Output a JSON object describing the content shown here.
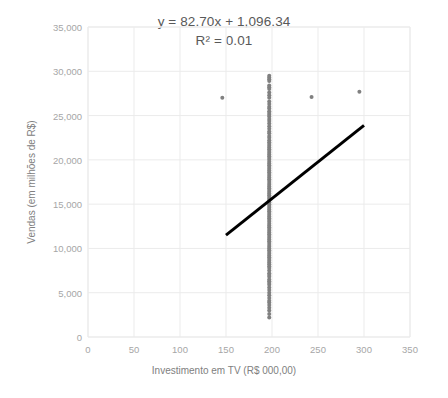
{
  "chart_data": {
    "type": "scatter",
    "title": "",
    "xlabel": "Investimento em TV (R$ 000,00)",
    "ylabel": "Vendas (em milhões de R$)",
    "xlim": [
      0,
      350
    ],
    "ylim": [
      0,
      35000
    ],
    "xticks": [
      0,
      50,
      100,
      150,
      200,
      250,
      300,
      350
    ],
    "yticks": [
      0,
      5000,
      10000,
      15000,
      20000,
      25000,
      30000,
      35000
    ],
    "xtick_labels": [
      "0",
      "50",
      "100",
      "150",
      "200",
      "250",
      "300",
      "350"
    ],
    "ytick_labels": [
      "0",
      "5,000",
      "10,000",
      "15,000",
      "20,000",
      "25,000",
      "30,000",
      "35,000"
    ],
    "grid": true,
    "legend": false,
    "annotations": {
      "equation": "y = 82.70x + 1,096.34",
      "r_squared": "R² = 0.01"
    },
    "trendline": {
      "type": "linear",
      "slope": 82.7,
      "intercept": 1096.34,
      "r2": 0.01,
      "x_start": 150,
      "y_start": 11500,
      "x_end": 300,
      "y_end": 23900,
      "color": "#000000",
      "width": 3
    },
    "marker": {
      "color": "#808080",
      "size": 4,
      "shape": "circle"
    },
    "series": [
      {
        "name": "Vendas vs Investimento em TV",
        "points": [
          [
            146,
            27000
          ],
          [
            243,
            27100
          ],
          [
            295,
            27700
          ],
          [
            197,
            29500
          ],
          [
            197,
            29300
          ],
          [
            197,
            29100
          ],
          [
            197,
            28900
          ],
          [
            197,
            28400
          ],
          [
            197,
            28200
          ],
          [
            197,
            28000
          ],
          [
            197,
            27600
          ],
          [
            197,
            27300
          ],
          [
            197,
            27000
          ],
          [
            197,
            26600
          ],
          [
            197,
            26300
          ],
          [
            197,
            26000
          ],
          [
            197,
            25800
          ],
          [
            197,
            25500
          ],
          [
            197,
            25300
          ],
          [
            197,
            25100
          ],
          [
            197,
            24900
          ],
          [
            197,
            24600
          ],
          [
            197,
            24400
          ],
          [
            197,
            24100
          ],
          [
            197,
            23800
          ],
          [
            197,
            23500
          ],
          [
            197,
            23200
          ],
          [
            197,
            23000
          ],
          [
            197,
            22700
          ],
          [
            197,
            22500
          ],
          [
            197,
            22200
          ],
          [
            197,
            22000
          ],
          [
            197,
            21800
          ],
          [
            197,
            21600
          ],
          [
            197,
            21400
          ],
          [
            197,
            21200
          ],
          [
            197,
            21000
          ],
          [
            197,
            20800
          ],
          [
            197,
            20600
          ],
          [
            197,
            20400
          ],
          [
            197,
            20200
          ],
          [
            197,
            20000
          ],
          [
            197,
            19800
          ],
          [
            197,
            19600
          ],
          [
            197,
            19400
          ],
          [
            197,
            19200
          ],
          [
            197,
            19000
          ],
          [
            197,
            18800
          ],
          [
            197,
            18600
          ],
          [
            197,
            18400
          ],
          [
            197,
            18200
          ],
          [
            197,
            18000
          ],
          [
            197,
            17800
          ],
          [
            197,
            17600
          ],
          [
            197,
            17400
          ],
          [
            197,
            17200
          ],
          [
            197,
            17000
          ],
          [
            197,
            16800
          ],
          [
            197,
            16600
          ],
          [
            197,
            16400
          ],
          [
            197,
            16200
          ],
          [
            197,
            16000
          ],
          [
            197,
            15800
          ],
          [
            197,
            15600
          ],
          [
            197,
            15400
          ],
          [
            197,
            15200
          ],
          [
            197,
            15000
          ],
          [
            197,
            14800
          ],
          [
            197,
            14600
          ],
          [
            197,
            14400
          ],
          [
            197,
            14200
          ],
          [
            197,
            14000
          ],
          [
            197,
            13800
          ],
          [
            197,
            13600
          ],
          [
            197,
            13400
          ],
          [
            197,
            13200
          ],
          [
            197,
            13000
          ],
          [
            197,
            12800
          ],
          [
            197,
            12600
          ],
          [
            197,
            12400
          ],
          [
            197,
            12200
          ],
          [
            197,
            12000
          ],
          [
            197,
            11800
          ],
          [
            197,
            11600
          ],
          [
            197,
            11400
          ],
          [
            197,
            11200
          ],
          [
            197,
            11000
          ],
          [
            197,
            10800
          ],
          [
            197,
            10600
          ],
          [
            197,
            10400
          ],
          [
            197,
            10200
          ],
          [
            197,
            10000
          ],
          [
            197,
            9800
          ],
          [
            197,
            9600
          ],
          [
            197,
            9400
          ],
          [
            197,
            9200
          ],
          [
            197,
            9000
          ],
          [
            197,
            8800
          ],
          [
            197,
            8600
          ],
          [
            197,
            8400
          ],
          [
            197,
            8200
          ],
          [
            197,
            8000
          ],
          [
            197,
            7800
          ],
          [
            197,
            7500
          ],
          [
            197,
            7200
          ],
          [
            197,
            7000
          ],
          [
            197,
            6800
          ],
          [
            197,
            6500
          ],
          [
            197,
            6300
          ],
          [
            197,
            6100
          ],
          [
            197,
            5900
          ],
          [
            197,
            5600
          ],
          [
            197,
            5300
          ],
          [
            197,
            5000
          ],
          [
            197,
            4700
          ],
          [
            197,
            4400
          ],
          [
            197,
            4100
          ],
          [
            197,
            3900
          ],
          [
            197,
            3600
          ],
          [
            197,
            3300
          ],
          [
            197,
            3000
          ],
          [
            197,
            2600
          ],
          [
            197,
            2200
          ]
        ]
      }
    ]
  }
}
